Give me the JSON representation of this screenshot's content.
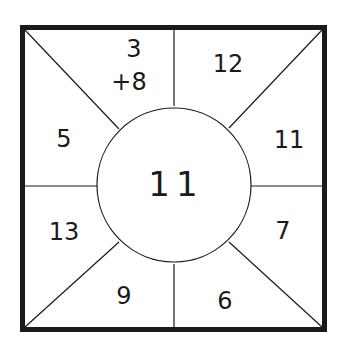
{
  "diagram": {
    "type": "number-wheel-square",
    "center": {
      "value": "11"
    },
    "sections": [
      {
        "position": "top-left",
        "value": "3\n+8",
        "line1": "3",
        "line2": "+8"
      },
      {
        "position": "top-right",
        "value": "12"
      },
      {
        "position": "right-upper",
        "value": "11"
      },
      {
        "position": "right-lower",
        "value": "7"
      },
      {
        "position": "bottom-right",
        "value": "6"
      },
      {
        "position": "bottom-left",
        "value": "9"
      },
      {
        "position": "left-lower",
        "value": "13"
      },
      {
        "position": "left-upper",
        "value": "5"
      }
    ],
    "colors": {
      "stroke": "#1a1a1a",
      "background": "#ffffff"
    }
  }
}
